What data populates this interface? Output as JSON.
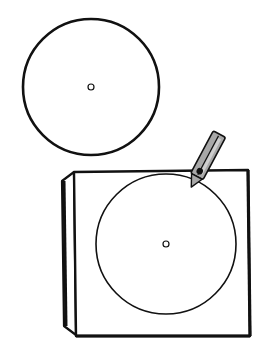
{
  "illustration": {
    "description": "Line drawing of a loose record disc and a record on a square turntable with a tone arm",
    "colors": {
      "background": "#ffffff",
      "stroke": "#111111",
      "arm_fill": "#a8a8a8",
      "arm_highlight": "#cfcfcf"
    },
    "loose_disc": {
      "cx": 91,
      "cy": 87,
      "r": 68,
      "hole_r": 3
    },
    "turntable": {
      "front": {
        "x": 74,
        "y": 172,
        "w": 174,
        "h": 162
      },
      "side_offset": 12
    },
    "platter_disc": {
      "cx": 166,
      "cy": 244,
      "r": 70,
      "hole_r": 3
    },
    "tone_arm": {
      "tip_x": 196,
      "tip_y": 187,
      "angle": 28
    }
  }
}
